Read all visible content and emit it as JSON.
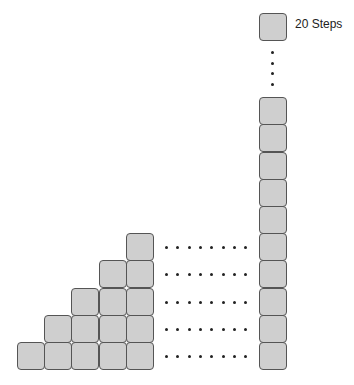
{
  "diagram": {
    "label": "20 Steps",
    "staircase_columns": 5,
    "tall_column_visible_blocks": 10,
    "tall_column_total_steps": 20,
    "horizontal_dots_per_row": 8,
    "vertical_dots": 4,
    "colors": {
      "block_fill": "#cfcfcf",
      "block_border": "#555555",
      "dot": "#222222"
    }
  }
}
